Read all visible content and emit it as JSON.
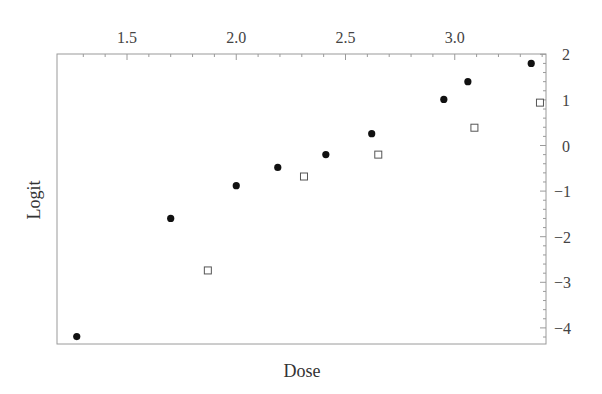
{
  "chart_data": {
    "type": "scatter",
    "title": "",
    "xlabel": "Dose",
    "ylabel": "Logit",
    "xlim": [
      1.23,
      3.47
    ],
    "ylim": [
      -4.33,
      2.0
    ],
    "x_ticks": [
      1.5,
      2.0,
      2.5,
      3.0
    ],
    "x_tick_labels": [
      "1.5",
      "2.0",
      "2.5",
      "3.0"
    ],
    "x_axis_position": "top",
    "y_ticks": [
      2,
      1,
      0,
      -1,
      -2,
      -3,
      -4
    ],
    "y_tick_labels": [
      "2",
      "1",
      "0",
      "−1",
      "−2",
      "−3",
      "−4"
    ],
    "y_axis_position": "right",
    "grid": false,
    "legend": null,
    "series": [
      {
        "name": "filled circles",
        "marker": "filled-circle",
        "color": "#111111",
        "points": [
          {
            "x": 1.27,
            "y": -4.19
          },
          {
            "x": 1.7,
            "y": -1.6
          },
          {
            "x": 2.0,
            "y": -0.88
          },
          {
            "x": 2.19,
            "y": -0.48
          },
          {
            "x": 2.41,
            "y": -0.2
          },
          {
            "x": 2.62,
            "y": 0.26
          },
          {
            "x": 2.95,
            "y": 1.01
          },
          {
            "x": 3.06,
            "y": 1.4
          },
          {
            "x": 3.35,
            "y": 1.8
          }
        ]
      },
      {
        "name": "open squares",
        "marker": "open-square",
        "color": "#555555",
        "points": [
          {
            "x": 1.87,
            "y": -2.74
          },
          {
            "x": 2.31,
            "y": -0.68
          },
          {
            "x": 2.65,
            "y": -0.2
          },
          {
            "x": 3.09,
            "y": 0.39
          },
          {
            "x": 3.39,
            "y": 0.94
          }
        ]
      }
    ]
  }
}
